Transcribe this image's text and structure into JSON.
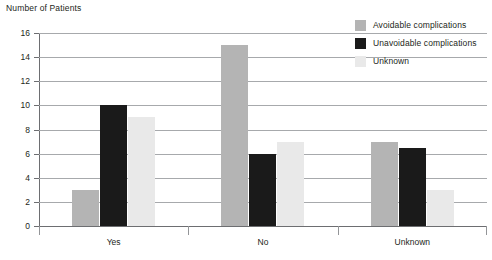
{
  "chart_data": {
    "type": "bar",
    "title": "Number of Patients",
    "xlabel": "",
    "ylabel": "Number of Patients",
    "ylim": [
      0,
      16
    ],
    "ytick_step": 2,
    "yticks": [
      0,
      2,
      4,
      6,
      8,
      10,
      12,
      14,
      16
    ],
    "grid": true,
    "legend_position": "top-right",
    "categories": [
      "Yes",
      "No",
      "Unknown"
    ],
    "series": [
      {
        "name": "Avoidable complications",
        "color": "#b4b4b4",
        "values": [
          3,
          15,
          7
        ]
      },
      {
        "name": "Unavoidable complications",
        "color": "#1a1a1a",
        "values": [
          10,
          6,
          6.5
        ]
      },
      {
        "name": "Unknown",
        "color": "#e9e9e9",
        "values": [
          9,
          7,
          3
        ]
      }
    ]
  },
  "axis": {
    "title": "Number of Patients",
    "y_tick_labels": [
      "16",
      "14",
      "12",
      "10",
      "8",
      "6",
      "4",
      "2",
      "0"
    ],
    "x_tick_labels": [
      "Yes",
      "No",
      "Unknown"
    ]
  },
  "legend": {
    "items": [
      {
        "label": "Avoidable complications",
        "color": "#b4b4b4"
      },
      {
        "label": "Unavoidable complications",
        "color": "#1a1a1a"
      },
      {
        "label": "Unknown",
        "color": "#e9e9e9"
      }
    ]
  }
}
